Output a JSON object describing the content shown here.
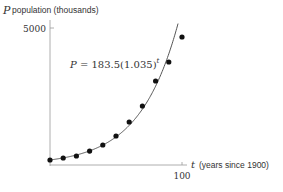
{
  "chart_data": {
    "type": "scatter",
    "title": "",
    "ylabel_var": "P",
    "ylabel_text": "population (thousands)",
    "xlabel_var": "t",
    "xlabel_text": "(years since 1900)",
    "xlim": [
      0,
      100
    ],
    "ylim": [
      0,
      5000
    ],
    "xticks": [
      100
    ],
    "xtick_labels": [
      "100"
    ],
    "yticks": [
      5000
    ],
    "ytick_labels": [
      "5000"
    ],
    "grid": false,
    "x": [
      0,
      10,
      20,
      30,
      40,
      50,
      60,
      70,
      80,
      90,
      100
    ],
    "values": [
      182,
      255,
      328,
      510,
      730,
      1058,
      1569,
      2153,
      3066,
      3759,
      4672
    ],
    "fit": {
      "label_lhs": "P = 183.5(1.035)",
      "label_exp": "t",
      "a": 183.5,
      "b": 1.035
    },
    "colors": {
      "points": "#111111",
      "curve": "#555555",
      "axes": "#999999",
      "text": "#333333"
    }
  }
}
